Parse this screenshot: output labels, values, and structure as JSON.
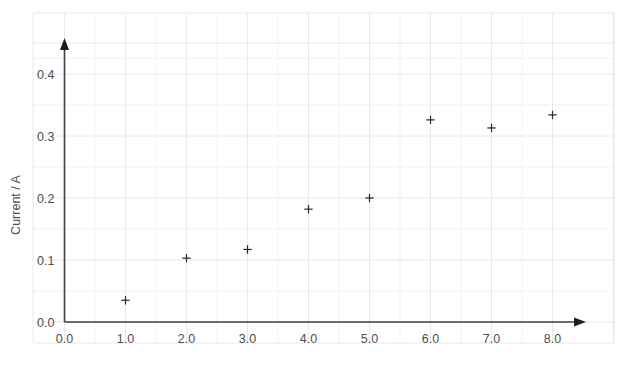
{
  "chart_data": {
    "type": "scatter",
    "title": "",
    "xlabel": "",
    "ylabel": "Current / A",
    "xlim": [
      0.0,
      8.6
    ],
    "ylim": [
      0.0,
      0.45
    ],
    "xticks": [
      "0.0",
      "1.0",
      "2.0",
      "3.0",
      "4.0",
      "5.0",
      "6.0",
      "7.0",
      "8.0"
    ],
    "xtick_values": [
      0.0,
      1.0,
      2.0,
      3.0,
      4.0,
      5.0,
      6.0,
      7.0,
      8.0
    ],
    "yticks": [
      "0.0",
      "0.1",
      "0.2",
      "0.3",
      "0.4"
    ],
    "ytick_values": [
      0.0,
      0.1,
      0.2,
      0.3,
      0.4
    ],
    "grid": true,
    "legend": "none",
    "marker": "plus",
    "marker_color": "#2b2b30",
    "x": [
      1.0,
      2.0,
      3.0,
      4.0,
      5.0,
      6.0,
      7.0,
      8.0
    ],
    "values": [
      0.035,
      0.103,
      0.117,
      0.182,
      0.2,
      0.326,
      0.313,
      0.334
    ],
    "points": [
      {
        "x": 1.0,
        "y": 0.035
      },
      {
        "x": 2.0,
        "y": 0.103
      },
      {
        "x": 3.0,
        "y": 0.117
      },
      {
        "x": 4.0,
        "y": 0.182
      },
      {
        "x": 5.0,
        "y": 0.2
      },
      {
        "x": 6.0,
        "y": 0.326
      },
      {
        "x": 7.0,
        "y": 0.313
      },
      {
        "x": 8.0,
        "y": 0.334
      }
    ]
  },
  "axes": {
    "y_title": "Current / A",
    "x_title": ""
  },
  "colors": {
    "grid_major": "#e8e8ea",
    "grid_minor": "#f3f3f5",
    "axis": "#3f3f44",
    "marker": "#2b2b30",
    "text": "#4d4d52",
    "background": "#ffffff"
  }
}
